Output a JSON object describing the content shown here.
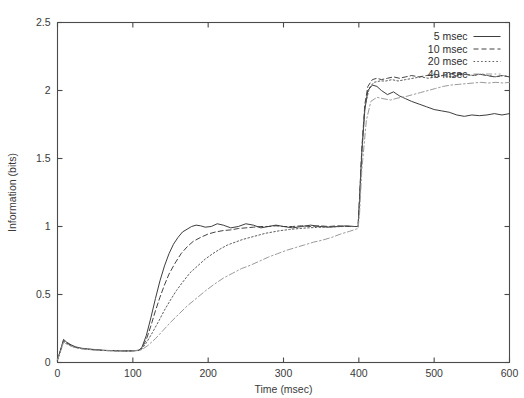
{
  "chart_data": {
    "type": "line",
    "title": "",
    "xlabel": "Time (msec)",
    "ylabel": "Information (bits)",
    "xlim": [
      0,
      600
    ],
    "ylim": [
      0,
      2.5
    ],
    "xticks": [
      0,
      100,
      200,
      300,
      400,
      500,
      600
    ],
    "yticks": [
      0,
      0.5,
      1,
      1.5,
      2,
      2.5
    ],
    "xtick_labels": [
      "0",
      "100",
      "200",
      "300",
      "400",
      "500",
      "600"
    ],
    "ytick_labels": [
      "0",
      "0.5",
      "1",
      "1.5",
      "2",
      "2.5"
    ],
    "grid": false,
    "legend_position": "top-right-inside",
    "annotations": [
      "initial transient peak near t=8 msec",
      "stimulus onset rise begins near t=110 msec",
      "plateau near 1.0 bits between 300 and 400 msec",
      "step transition at t=400 msec"
    ],
    "series": [
      {
        "name": "5 msec",
        "style": "solid",
        "color": "#333333",
        "x": [
          0,
          4,
          8,
          12,
          18,
          24,
          32,
          40,
          50,
          60,
          70,
          80,
          90,
          100,
          108,
          112,
          118,
          124,
          130,
          136,
          142,
          148,
          154,
          160,
          166,
          172,
          178,
          184,
          190,
          196,
          204,
          212,
          220,
          230,
          240,
          250,
          260,
          270,
          280,
          290,
          300,
          312,
          324,
          336,
          348,
          360,
          372,
          384,
          394,
          399,
          401,
          404,
          408,
          412,
          418,
          424,
          430,
          438,
          446,
          454,
          462,
          470,
          480,
          490,
          500,
          510,
          520,
          530,
          540,
          550,
          560,
          570,
          580,
          590,
          600
        ],
        "y": [
          0.02,
          0.09,
          0.17,
          0.15,
          0.13,
          0.115,
          0.105,
          0.1,
          0.095,
          0.09,
          0.088,
          0.086,
          0.085,
          0.086,
          0.09,
          0.11,
          0.2,
          0.33,
          0.47,
          0.6,
          0.71,
          0.8,
          0.87,
          0.92,
          0.96,
          0.98,
          1.0,
          1.01,
          1.005,
          0.995,
          1.0,
          1.02,
          1.01,
          0.99,
          1.0,
          1.02,
          1.01,
          0.99,
          1.0,
          1.01,
          1.0,
          0.99,
          1.0,
          1.01,
          1.0,
          0.995,
          1.0,
          1.005,
          1.0,
          1.0,
          1.2,
          1.55,
          1.86,
          2.0,
          2.04,
          2.03,
          2.0,
          1.97,
          1.99,
          1.96,
          1.94,
          1.92,
          1.9,
          1.88,
          1.86,
          1.85,
          1.84,
          1.82,
          1.81,
          1.82,
          1.815,
          1.82,
          1.83,
          1.82,
          1.83
        ]
      },
      {
        "name": "10 msec",
        "style": "dashed",
        "color": "#3a3a3a",
        "x": [
          0,
          4,
          8,
          12,
          18,
          24,
          32,
          40,
          50,
          60,
          70,
          80,
          90,
          100,
          108,
          112,
          118,
          124,
          130,
          136,
          142,
          148,
          156,
          164,
          172,
          180,
          190,
          200,
          210,
          220,
          230,
          240,
          250,
          260,
          270,
          280,
          290,
          300,
          312,
          324,
          336,
          348,
          360,
          372,
          384,
          394,
          399,
          401,
          404,
          408,
          412,
          418,
          424,
          430,
          438,
          446,
          454,
          462,
          470,
          480,
          490,
          500,
          510,
          520,
          530,
          540,
          550,
          560,
          570,
          580,
          590,
          600
        ],
        "y": [
          0.02,
          0.09,
          0.16,
          0.145,
          0.125,
          0.112,
          0.103,
          0.098,
          0.093,
          0.089,
          0.087,
          0.086,
          0.085,
          0.086,
          0.09,
          0.105,
          0.17,
          0.27,
          0.38,
          0.48,
          0.57,
          0.65,
          0.73,
          0.8,
          0.85,
          0.89,
          0.92,
          0.945,
          0.96,
          0.97,
          0.975,
          0.985,
          0.99,
          0.995,
          1.0,
          1.0,
          1.005,
          1.0,
          1.0,
          1.005,
          1.0,
          1.005,
          1.0,
          1.005,
          1.0,
          1.0,
          1.0,
          1.22,
          1.58,
          1.9,
          2.03,
          2.08,
          2.09,
          2.08,
          2.09,
          2.1,
          2.09,
          2.1,
          2.11,
          2.1,
          2.11,
          2.12,
          2.11,
          2.12,
          2.13,
          2.12,
          2.11,
          2.12,
          2.11,
          2.1,
          2.11,
          2.1
        ]
      },
      {
        "name": "20 msec",
        "style": "dotted",
        "color": "#555555",
        "x": [
          0,
          4,
          8,
          12,
          18,
          24,
          32,
          40,
          50,
          60,
          70,
          80,
          90,
          100,
          108,
          112,
          118,
          126,
          134,
          142,
          150,
          158,
          166,
          176,
          186,
          196,
          206,
          216,
          226,
          236,
          246,
          256,
          266,
          276,
          286,
          296,
          308,
          320,
          332,
          344,
          356,
          368,
          380,
          390,
          399,
          401,
          404,
          408,
          414,
          420,
          428,
          436,
          444,
          452,
          462,
          472,
          482,
          492,
          502,
          512,
          522,
          532,
          542,
          552,
          562,
          572,
          582,
          592,
          600
        ],
        "y": [
          0.02,
          0.085,
          0.155,
          0.14,
          0.122,
          0.11,
          0.102,
          0.097,
          0.092,
          0.089,
          0.087,
          0.086,
          0.085,
          0.086,
          0.089,
          0.1,
          0.145,
          0.22,
          0.3,
          0.385,
          0.46,
          0.53,
          0.59,
          0.66,
          0.71,
          0.76,
          0.8,
          0.835,
          0.865,
          0.885,
          0.905,
          0.92,
          0.935,
          0.95,
          0.96,
          0.97,
          0.978,
          0.985,
          0.99,
          0.993,
          0.996,
          0.998,
          1.0,
          1.0,
          1.0,
          1.2,
          1.55,
          1.88,
          2.02,
          2.06,
          2.07,
          2.07,
          2.08,
          2.07,
          2.08,
          2.09,
          2.1,
          2.09,
          2.1,
          2.11,
          2.1,
          2.11,
          2.12,
          2.11,
          2.12,
          2.11,
          2.1,
          2.11,
          2.1
        ]
      },
      {
        "name": "40 msec",
        "style": "dashdot",
        "color": "#9a9a9a",
        "x": [
          0,
          4,
          8,
          12,
          18,
          24,
          32,
          40,
          50,
          60,
          70,
          80,
          90,
          100,
          108,
          112,
          120,
          130,
          140,
          150,
          160,
          172,
          184,
          196,
          208,
          220,
          232,
          244,
          256,
          268,
          280,
          292,
          304,
          316,
          328,
          340,
          352,
          364,
          376,
          388,
          396,
          399,
          401,
          404,
          410,
          416,
          424,
          432,
          442,
          452,
          462,
          472,
          482,
          492,
          502,
          512,
          522,
          532,
          542,
          552,
          562,
          572,
          582,
          592,
          600
        ],
        "y": [
          0.02,
          0.08,
          0.15,
          0.135,
          0.12,
          0.108,
          0.1,
          0.096,
          0.091,
          0.088,
          0.086,
          0.085,
          0.084,
          0.085,
          0.088,
          0.095,
          0.125,
          0.175,
          0.235,
          0.295,
          0.35,
          0.415,
          0.47,
          0.525,
          0.575,
          0.62,
          0.655,
          0.69,
          0.715,
          0.745,
          0.775,
          0.8,
          0.825,
          0.845,
          0.865,
          0.885,
          0.9,
          0.92,
          0.945,
          0.965,
          0.98,
          0.985,
          1.1,
          1.42,
          1.78,
          1.92,
          1.95,
          1.94,
          1.93,
          1.945,
          1.955,
          1.97,
          1.985,
          2.0,
          2.015,
          2.03,
          2.04,
          2.045,
          2.05,
          2.055,
          2.06,
          2.055,
          2.06,
          2.055,
          2.06
        ]
      }
    ]
  },
  "legend": {
    "items": [
      {
        "label": "5 msec",
        "style": "solid"
      },
      {
        "label": "10 msec",
        "style": "dashed"
      },
      {
        "label": "20 msec",
        "style": "dotted"
      },
      {
        "label": "40 msec",
        "style": "dashdot"
      }
    ]
  }
}
